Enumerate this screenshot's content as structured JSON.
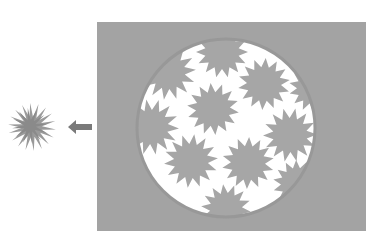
{
  "diagram": {
    "colors": {
      "background": "#ffffff",
      "panel": "#a3a3a3",
      "circle_fill": "#ffffff",
      "circle_border": "#989898",
      "star": "#a6a6a6",
      "single_star": "#9a9a9a",
      "arrow": "#7a7a7a"
    },
    "panel": {
      "x": 97,
      "y": 22,
      "width": 269,
      "height": 209
    },
    "circle": {
      "cx": 226,
      "cy": 128,
      "r": 89
    },
    "arrow": {
      "x1": 92,
      "y1": 127,
      "x2": 68,
      "y2": 127,
      "direction": "left"
    },
    "single_star": {
      "cx": 32,
      "cy": 127,
      "r_outer": 24,
      "r_inner": 10,
      "points": 18
    },
    "stars": [
      {
        "cx": 222,
        "cy": 52,
        "r_outer": 26,
        "r_inner": 17,
        "points": 14
      },
      {
        "cx": 168,
        "cy": 72,
        "r_outer": 28,
        "r_inner": 17,
        "points": 14
      },
      {
        "cx": 264,
        "cy": 84,
        "r_outer": 26,
        "r_inner": 17,
        "points": 14
      },
      {
        "cx": 313,
        "cy": 88,
        "r_outer": 24,
        "r_inner": 16,
        "points": 14
      },
      {
        "cx": 213,
        "cy": 109,
        "r_outer": 26,
        "r_inner": 17,
        "points": 14
      },
      {
        "cx": 151,
        "cy": 127,
        "r_outer": 28,
        "r_inner": 17,
        "points": 14
      },
      {
        "cx": 290,
        "cy": 135,
        "r_outer": 27,
        "r_inner": 17,
        "points": 14
      },
      {
        "cx": 191,
        "cy": 161,
        "r_outer": 27,
        "r_inner": 17,
        "points": 14
      },
      {
        "cx": 248,
        "cy": 163,
        "r_outer": 26,
        "r_inner": 17,
        "points": 14
      },
      {
        "cx": 297,
        "cy": 184,
        "r_outer": 24,
        "r_inner": 16,
        "points": 14
      },
      {
        "cx": 226,
        "cy": 209,
        "r_outer": 25,
        "r_inner": 16,
        "points": 14
      }
    ]
  }
}
